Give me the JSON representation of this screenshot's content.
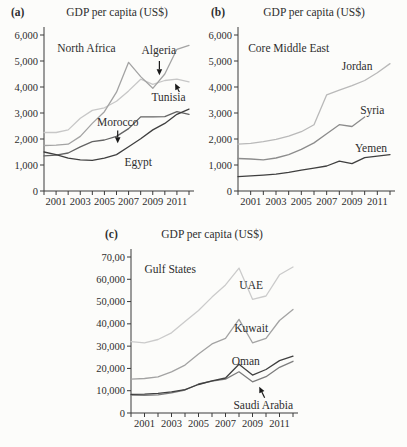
{
  "chart_data": [
    {
      "type": "line",
      "letter": "(a)",
      "title": "GDP per capita (US$)",
      "region_label": {
        "text": "North Africa",
        "x": 2001.1,
        "y": 5500
      },
      "x_years": [
        2000,
        2001,
        2002,
        2003,
        2004,
        2005,
        2006,
        2007,
        2008,
        2009,
        2010,
        2011,
        2012
      ],
      "xtick_label_years": [
        2001,
        2003,
        2005,
        2007,
        2009,
        2011
      ],
      "ylim": [
        0,
        6000
      ],
      "yticks": [
        {
          "v": 0,
          "label": "0"
        },
        {
          "v": 1000,
          "label": "1,000"
        },
        {
          "v": 2000,
          "label": "2,000"
        },
        {
          "v": 3000,
          "label": "3,000"
        },
        {
          "v": 4000,
          "label": "4,000"
        },
        {
          "v": 5000,
          "label": "5,000"
        },
        {
          "v": 6000,
          "label": "6,000"
        }
      ],
      "series": [
        {
          "name": "Tunisia",
          "color": "#c7c7c7",
          "values": [
            2250,
            2250,
            2350,
            2800,
            3100,
            3200,
            3450,
            3850,
            4300,
            4100,
            4250,
            4300,
            4200
          ]
        },
        {
          "name": "Algeria",
          "color": "#a3a3a3",
          "values": [
            1750,
            1760,
            1800,
            2100,
            2600,
            3050,
            3800,
            4950,
            4400,
            3950,
            4500,
            5450,
            5600
          ]
        },
        {
          "name": "Morocco",
          "color": "#636363",
          "values": [
            1350,
            1380,
            1460,
            1700,
            1900,
            1960,
            2100,
            2400,
            2850,
            2850,
            2860,
            3050,
            2950
          ]
        },
        {
          "name": "Egypt",
          "color": "#3f3f3f",
          "values": [
            1500,
            1400,
            1260,
            1200,
            1180,
            1260,
            1400,
            1700,
            2010,
            2350,
            2600,
            2950,
            3150
          ]
        }
      ],
      "country_labels": [
        {
          "text": "Algeria",
          "x": 2009.5,
          "y": 5420,
          "anchor": "middle"
        },
        {
          "text": "Tunisia",
          "x": 2010.3,
          "y": 3600,
          "anchor": "middle"
        },
        {
          "text": "Morocco",
          "x": 2006.1,
          "y": 2640,
          "anchor": "middle"
        },
        {
          "text": "Egypt",
          "x": 2007.8,
          "y": 1100,
          "anchor": "middle"
        }
      ],
      "arrows": [
        {
          "x1": 2009.55,
          "y1": 5000,
          "x2": 2009.55,
          "y2": 4450
        },
        {
          "x1": 2011.2,
          "y1": 3810,
          "x2": 2010.85,
          "y2": 4130
        },
        {
          "x1": 2006.1,
          "y1": 2330,
          "x2": 2006.1,
          "y2": 1840
        }
      ]
    },
    {
      "type": "line",
      "letter": "(b)",
      "title": "GDP per capita (US$)",
      "region_label": {
        "text": "Core Middle East",
        "x": 2000.8,
        "y": 5500
      },
      "x_years": [
        2000,
        2001,
        2002,
        2003,
        2004,
        2005,
        2006,
        2007,
        2008,
        2009,
        2010,
        2011,
        2012
      ],
      "xtick_label_years": [
        2001,
        2003,
        2005,
        2007,
        2009,
        2011
      ],
      "ylim": [
        0,
        6000
      ],
      "yticks": [
        {
          "v": 0,
          "label": "0"
        },
        {
          "v": 1000,
          "label": "1,000"
        },
        {
          "v": 2000,
          "label": "2,000"
        },
        {
          "v": 3000,
          "label": "3,000"
        },
        {
          "v": 4000,
          "label": "4,000"
        },
        {
          "v": 5000,
          "label": "5,000"
        },
        {
          "v": 6000,
          "label": "6,000"
        }
      ],
      "series": [
        {
          "name": "Jordan",
          "color": "#b9b9b9",
          "values": [
            1800,
            1830,
            1900,
            1990,
            2110,
            2280,
            2550,
            3700,
            3880,
            4050,
            4250,
            4550,
            4900
          ]
        },
        {
          "name": "Syria",
          "color": "#8c8c8c",
          "values": [
            1250,
            1230,
            1200,
            1270,
            1400,
            1600,
            1850,
            2200,
            2550,
            2480,
            2850
          ]
        },
        {
          "name": "Yemen",
          "color": "#3f3f3f",
          "values": [
            550,
            580,
            610,
            650,
            720,
            800,
            880,
            960,
            1150,
            1050,
            1280,
            1340,
            1400
          ]
        }
      ],
      "country_labels": [
        {
          "text": "Jordan",
          "x": 2009.4,
          "y": 4800,
          "anchor": "middle"
        },
        {
          "text": "Syria",
          "x": 2010.6,
          "y": 3080,
          "anchor": "middle"
        },
        {
          "text": "Yemen",
          "x": 2010.5,
          "y": 1620,
          "anchor": "middle"
        }
      ],
      "arrows": []
    },
    {
      "type": "line",
      "letter": "(c)",
      "title": "GDP per capita (US$)",
      "region_label": {
        "text": "Gulf States",
        "x": 2001.0,
        "y": 64500
      },
      "x_years": [
        2000,
        2001,
        2002,
        2003,
        2004,
        2005,
        2006,
        2007,
        2008,
        2009,
        2010,
        2011,
        2012
      ],
      "xtick_label_years": [
        2001,
        2003,
        2005,
        2007,
        2009,
        2011
      ],
      "ylim": [
        0,
        70000
      ],
      "yticks": [
        {
          "v": 0,
          "label": "0"
        },
        {
          "v": 10000,
          "label": "10,000"
        },
        {
          "v": 20000,
          "label": "20,000"
        },
        {
          "v": 30000,
          "label": "30,000"
        },
        {
          "v": 40000,
          "label": "40,000"
        },
        {
          "v": 50000,
          "label": "50,000"
        },
        {
          "v": 60000,
          "label": "60,000"
        },
        {
          "v": 70000,
          "label": "70,00"
        }
      ],
      "series": [
        {
          "name": "UAE",
          "color": "#cbcbcb",
          "values": [
            32000,
            31500,
            33000,
            36000,
            41000,
            46000,
            52000,
            57500,
            65000,
            51000,
            52500,
            62000,
            65500
          ]
        },
        {
          "name": "Kuwait",
          "color": "#a3a3a3",
          "values": [
            15200,
            15500,
            16200,
            18500,
            21500,
            26500,
            31000,
            33500,
            42000,
            31500,
            33500,
            41500,
            46500
          ]
        },
        {
          "name": "Saudi Arabia",
          "color": "#7d7d7d",
          "values": [
            8000,
            7900,
            8100,
            9000,
            10300,
            13000,
            14300,
            15200,
            18500,
            14000,
            16300,
            20500,
            23200
          ]
        },
        {
          "name": "Oman",
          "color": "#3f3f3f",
          "values": [
            8400,
            8500,
            8800,
            9500,
            10500,
            12800,
            14400,
            15700,
            21900,
            17000,
            19500,
            23500,
            25500
          ]
        }
      ],
      "country_labels": [
        {
          "text": "UAE",
          "x": 2008.9,
          "y": 57000,
          "anchor": "middle"
        },
        {
          "text": "Kuwait",
          "x": 2008.9,
          "y": 37700,
          "anchor": "middle"
        },
        {
          "text": "Oman",
          "x": 2008.5,
          "y": 23000,
          "anchor": "middle"
        },
        {
          "text": "Saudi Arabia",
          "x": 2009.8,
          "y": 3400,
          "anchor": "middle"
        }
      ],
      "arrows": [
        {
          "x1": 2009.9,
          "y1": 6800,
          "x2": 2009.5,
          "y2": 11800
        }
      ]
    }
  ]
}
